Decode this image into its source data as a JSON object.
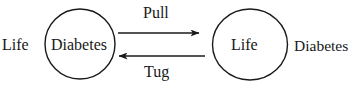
{
  "diagram": {
    "type": "node-edge-diagram",
    "width": 360,
    "height": 92,
    "background_color": "#ffffff",
    "stroke_color": "#1a1a1a",
    "text_color": "#181818",
    "nodes": [
      {
        "id": "node-left",
        "label": "Diabetes",
        "shape": "circle",
        "cx": 80,
        "cy": 44,
        "rx": 35,
        "ry": 35
      },
      {
        "id": "node-right",
        "label": "Life",
        "shape": "circle",
        "cx": 250,
        "cy": 44,
        "rx": 37.5,
        "ry": 35.5
      }
    ],
    "edges": [
      {
        "id": "edge-top",
        "label": "Pull",
        "direction": "right",
        "from": "node-left",
        "to": "node-right",
        "x1": 118,
        "x2": 199,
        "y": 33
      },
      {
        "id": "edge-bottom",
        "label": "Tug",
        "direction": "left",
        "from": "node-right",
        "to": "node-left",
        "x1": 205,
        "x2": 119,
        "y": 56
      }
    ],
    "outside_labels": {
      "left": "Life",
      "right": "Diabetes"
    }
  }
}
